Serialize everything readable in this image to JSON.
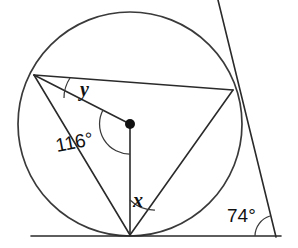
{
  "figure": {
    "type": "geometry-diagram",
    "background_color": "#ffffff",
    "stroke_color": "#2a2a2a",
    "labels": {
      "angle_center": "116°",
      "angle_exterior": "74°",
      "variable_upper": "y",
      "variable_lower": "x"
    },
    "circle": {
      "center_x": 130,
      "center_y": 124,
      "radius": 112,
      "center_marked": true
    },
    "points": {
      "left_vertex": {
        "x": 34,
        "y": 75
      },
      "right_vertex": {
        "x": 233,
        "y": 90
      },
      "bottom_vertex": {
        "x": 130,
        "y": 235
      },
      "center": {
        "x": 130,
        "y": 124
      },
      "tangent_top": {
        "x": 218,
        "y": 0
      },
      "tangent_bottom": {
        "x": 276,
        "y": 237
      },
      "baseline_left": {
        "x": 31,
        "y": 236
      },
      "baseline_right": {
        "x": 281,
        "y": 236
      }
    },
    "segments": [
      {
        "name": "chord-left-to-right",
        "from": "left_vertex",
        "to": "right_vertex"
      },
      {
        "name": "radius-left-to-center",
        "from": "left_vertex",
        "to": "center"
      },
      {
        "name": "chord-left-to-bottom",
        "from": "left_vertex",
        "to": "bottom_vertex"
      },
      {
        "name": "radius-center-to-bottom",
        "from": "center",
        "to": "bottom_vertex"
      },
      {
        "name": "chord-bottom-to-right",
        "from": "bottom_vertex",
        "to": "right_vertex"
      },
      {
        "name": "tangent-line",
        "from": "tangent_top",
        "to": "tangent_bottom"
      },
      {
        "name": "baseline",
        "from": "baseline_left",
        "to": "baseline_right"
      }
    ],
    "angle_marks": [
      {
        "name": "center-angle-arc",
        "value": "116°",
        "vertex": "center"
      },
      {
        "name": "y-angle-arc",
        "value": "y",
        "vertex": "left_vertex"
      },
      {
        "name": "x-angle-arc",
        "value": "x",
        "vertex": "bottom_vertex"
      },
      {
        "name": "exterior-angle-arc",
        "value": "74°",
        "vertex": "tangent_bottom"
      }
    ],
    "label_positions": {
      "angle_center": {
        "x": 57,
        "y": 152
      },
      "angle_exterior": {
        "x": 227,
        "y": 222
      },
      "variable_upper": {
        "x": 80,
        "y": 96
      },
      "variable_lower": {
        "x": 133,
        "y": 207
      }
    }
  }
}
